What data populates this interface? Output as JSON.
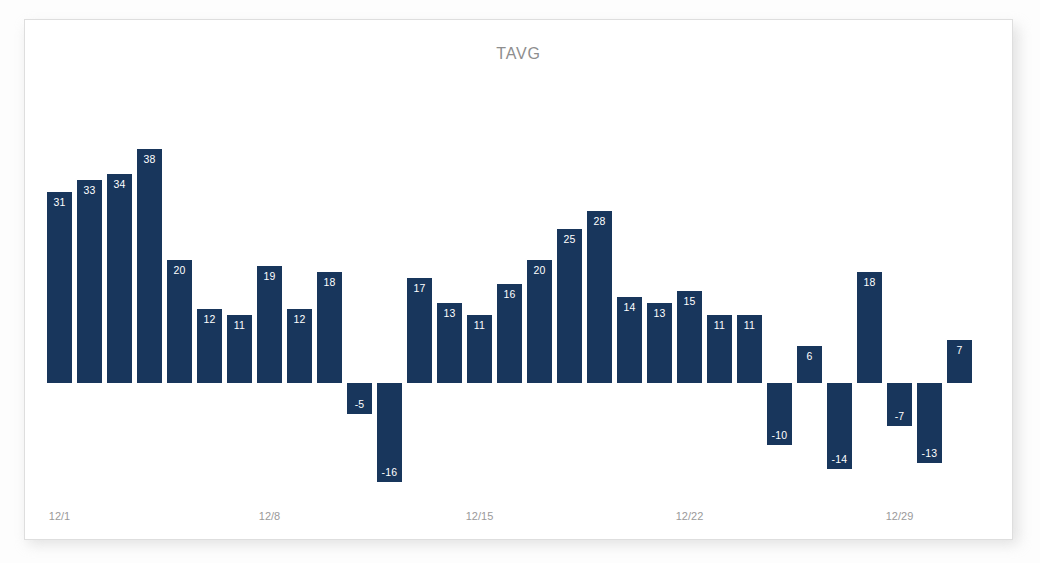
{
  "card": {
    "title": "TAVG"
  },
  "chart_data": {
    "type": "bar",
    "title": "TAVG",
    "xlabel": "",
    "ylabel": "",
    "grid": false,
    "legend": null,
    "baseline": 0,
    "ylim": [
      -20,
      42
    ],
    "categories": [
      "12/1",
      "12/2",
      "12/3",
      "12/4",
      "12/5",
      "12/6",
      "12/7",
      "12/8",
      "12/9",
      "12/10",
      "12/11",
      "12/12",
      "12/13",
      "12/14",
      "12/15",
      "12/16",
      "12/17",
      "12/18",
      "12/19",
      "12/20",
      "12/21",
      "12/22",
      "12/23",
      "12/24",
      "12/25",
      "12/26",
      "12/27",
      "12/28",
      "12/29",
      "12/30",
      "12/31"
    ],
    "values": [
      31,
      33,
      34,
      38,
      20,
      12,
      11,
      19,
      12,
      18,
      -5,
      -16,
      17,
      13,
      11,
      16,
      20,
      25,
      28,
      14,
      13,
      15,
      11,
      11,
      -10,
      6,
      -14,
      18,
      -7,
      -13,
      7
    ],
    "tick_labels": [
      "12/1",
      "12/8",
      "12/15",
      "12/22",
      "12/29"
    ],
    "tick_indices": [
      0,
      7,
      14,
      21,
      28
    ],
    "bar_color": "#18365c",
    "label_color": "#ffffff",
    "axis_label_color": "#9a9a9a",
    "title_color": "#8e8e8e",
    "background": "#ffffff"
  }
}
